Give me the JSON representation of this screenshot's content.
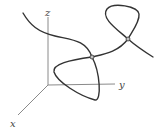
{
  "figure": {
    "colors": {
      "axis": "#8a8a8a",
      "curve": "#333333",
      "point_fill": "#bfbfbf"
    },
    "axes": {
      "origin": [
        48,
        85
      ],
      "z": {
        "label": "z",
        "end": [
          48,
          17
        ],
        "label_pos": [
          45,
          16
        ]
      },
      "y": {
        "label": "y",
        "end": [
          115,
          84
        ],
        "label_pos": [
          119,
          88
        ]
      },
      "x": {
        "label": "x",
        "end": [
          18,
          115
        ],
        "label_pos": [
          10,
          127
        ]
      }
    },
    "curve_paths": {
      "upper_left_arc": "M23,13 C30,25 38,32 55,36 C72,40 86,40 92,57",
      "lower_loop": "M92,57 C70,60 52,64 54,72 C57,82 80,96 95,100 C102,101 100,72 92,57",
      "middle_link": "M92,57 C105,54 118,52 128,39",
      "upper_right_loop": "M128,39 C118,30 100,18 107,9 C113,2 138,6 139,14 C140,22 131,33 128,39",
      "tail": "M128,39 C136,46 145,52 153,57"
    },
    "crossing_points": [
      {
        "name": "crossing-point-1",
        "x": 92,
        "y": 57
      },
      {
        "name": "crossing-point-2",
        "x": 128,
        "y": 39
      }
    ]
  }
}
